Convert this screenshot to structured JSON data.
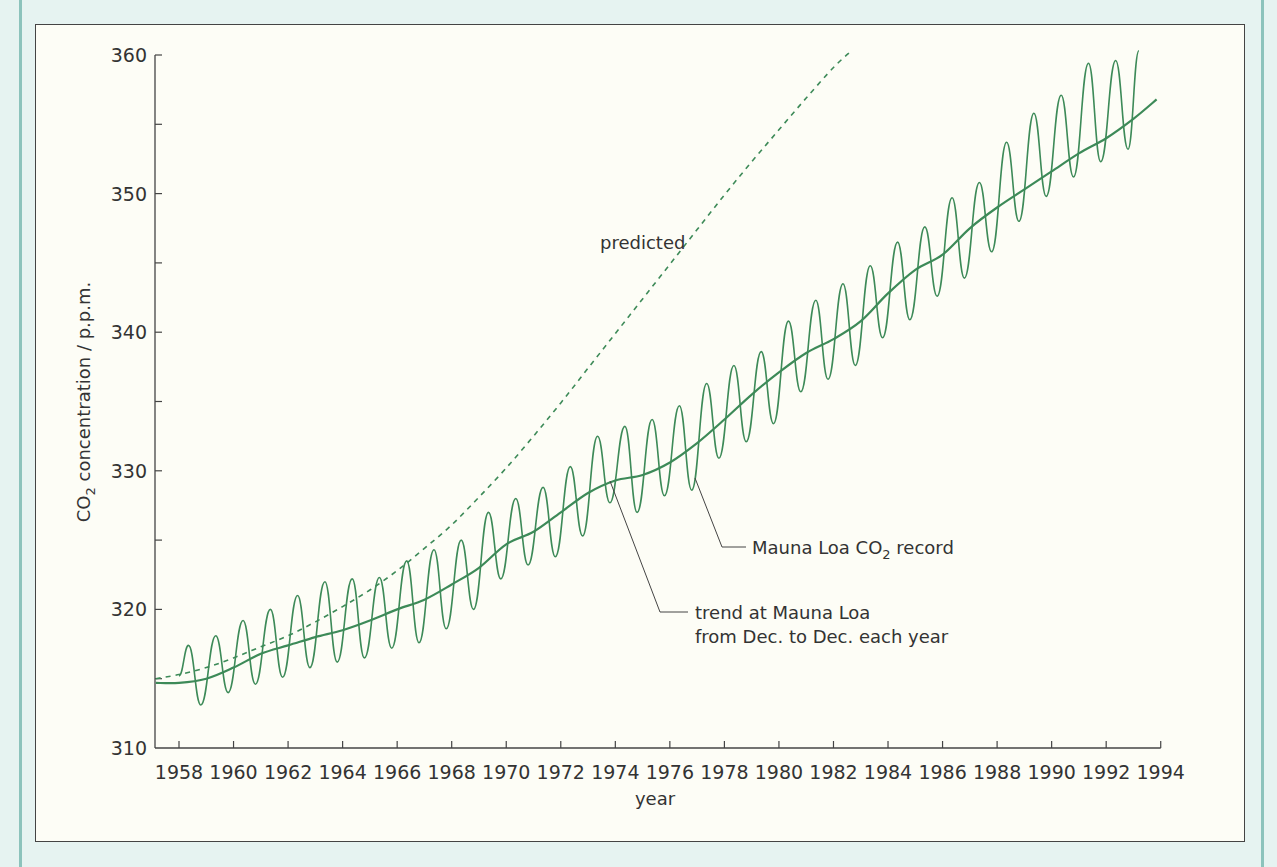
{
  "colors": {
    "line": "#3d8a58",
    "axis": "#444444",
    "text": "#333333",
    "outer_bg": "#e6f3f1",
    "plot_bg": "#fdfdf6"
  },
  "chart_data": {
    "type": "line",
    "title": "",
    "xlabel": "year",
    "ylabel": "CO2 concentration / p.p.m.",
    "ylabel_parts": {
      "pre": "CO",
      "sub": "2",
      "post": " concentration / p.p.m."
    },
    "xlim": [
      1957.1,
      1994
    ],
    "ylim": [
      310,
      360
    ],
    "grid": false,
    "x_ticks": [
      1958,
      1960,
      1962,
      1964,
      1966,
      1968,
      1970,
      1972,
      1974,
      1976,
      1978,
      1980,
      1982,
      1984,
      1986,
      1988,
      1990,
      1992,
      1994
    ],
    "x_tick_labels": [
      "1958",
      "1960",
      "1962",
      "1964",
      "1966",
      "1968",
      "1970",
      "1972",
      "1974",
      "1976",
      "1978",
      "1980",
      "1982",
      "1984",
      "1986",
      "1988",
      "1990",
      "1992",
      "1994"
    ],
    "y_ticks_major": [
      310,
      320,
      330,
      340,
      350,
      360
    ],
    "y_tick_labels": [
      "310",
      "320",
      "330",
      "340",
      "350",
      "360"
    ],
    "y_ticks_minor": [
      315,
      325,
      335,
      345,
      355
    ],
    "series": [
      {
        "name": "Mauna Loa CO2 record",
        "style": "solid-seasonal",
        "extrema": [
          [
            1958.0,
            315.2
          ],
          [
            1958.35,
            317.4
          ],
          [
            1958.8,
            313.1
          ],
          [
            1959.35,
            318.1
          ],
          [
            1959.8,
            314.0
          ],
          [
            1960.35,
            319.2
          ],
          [
            1960.8,
            314.6
          ],
          [
            1961.35,
            320.0
          ],
          [
            1961.8,
            315.1
          ],
          [
            1962.35,
            321.0
          ],
          [
            1962.8,
            315.8
          ],
          [
            1963.35,
            322.0
          ],
          [
            1963.8,
            316.2
          ],
          [
            1964.35,
            322.2
          ],
          [
            1964.8,
            316.5
          ],
          [
            1965.35,
            322.3
          ],
          [
            1965.8,
            317.2
          ],
          [
            1966.35,
            323.5
          ],
          [
            1966.8,
            317.6
          ],
          [
            1967.35,
            324.3
          ],
          [
            1967.8,
            318.6
          ],
          [
            1968.35,
            325.0
          ],
          [
            1968.8,
            320.0
          ],
          [
            1969.35,
            327.0
          ],
          [
            1969.8,
            322.2
          ],
          [
            1970.35,
            328.0
          ],
          [
            1970.8,
            323.2
          ],
          [
            1971.35,
            328.8
          ],
          [
            1971.8,
            323.8
          ],
          [
            1972.35,
            330.3
          ],
          [
            1972.8,
            325.3
          ],
          [
            1973.35,
            332.5
          ],
          [
            1973.8,
            327.7
          ],
          [
            1974.35,
            333.2
          ],
          [
            1974.8,
            327.0
          ],
          [
            1975.35,
            333.7
          ],
          [
            1975.8,
            328.2
          ],
          [
            1976.35,
            334.7
          ],
          [
            1976.8,
            328.6
          ],
          [
            1977.35,
            336.3
          ],
          [
            1977.8,
            330.9
          ],
          [
            1978.35,
            337.6
          ],
          [
            1978.8,
            332.1
          ],
          [
            1979.35,
            338.6
          ],
          [
            1979.8,
            333.4
          ],
          [
            1980.35,
            340.8
          ],
          [
            1980.8,
            335.7
          ],
          [
            1981.35,
            342.3
          ],
          [
            1981.8,
            336.6
          ],
          [
            1982.35,
            343.5
          ],
          [
            1982.8,
            337.6
          ],
          [
            1983.35,
            344.8
          ],
          [
            1983.8,
            339.6
          ],
          [
            1984.35,
            346.5
          ],
          [
            1984.8,
            340.9
          ],
          [
            1985.35,
            347.6
          ],
          [
            1985.8,
            342.6
          ],
          [
            1986.35,
            349.7
          ],
          [
            1986.8,
            343.9
          ],
          [
            1987.35,
            350.8
          ],
          [
            1987.8,
            345.8
          ],
          [
            1988.35,
            353.7
          ],
          [
            1988.8,
            348.0
          ],
          [
            1989.35,
            355.8
          ],
          [
            1989.8,
            349.8
          ],
          [
            1990.35,
            357.1
          ],
          [
            1990.8,
            351.2
          ],
          [
            1991.35,
            359.4
          ],
          [
            1991.8,
            352.3
          ],
          [
            1992.35,
            359.6
          ],
          [
            1992.8,
            353.2
          ],
          [
            1993.2,
            360.3
          ]
        ]
      },
      {
        "name": "trend at Mauna Loa from Dec. to Dec. each year",
        "style": "solid-smooth",
        "points": [
          [
            1957.15,
            314.7
          ],
          [
            1958.0,
            314.7
          ],
          [
            1959.0,
            315.0
          ],
          [
            1960.0,
            315.8
          ],
          [
            1961.0,
            316.8
          ],
          [
            1962.0,
            317.4
          ],
          [
            1963.0,
            318.0
          ],
          [
            1964.0,
            318.5
          ],
          [
            1965.0,
            319.2
          ],
          [
            1966.0,
            320.0
          ],
          [
            1967.0,
            320.7
          ],
          [
            1968.0,
            321.8
          ],
          [
            1969.0,
            323.0
          ],
          [
            1970.0,
            324.7
          ],
          [
            1971.0,
            325.6
          ],
          [
            1972.0,
            327.0
          ],
          [
            1973.0,
            328.4
          ],
          [
            1974.0,
            329.3
          ],
          [
            1975.0,
            329.7
          ],
          [
            1976.0,
            330.6
          ],
          [
            1977.0,
            332.0
          ],
          [
            1978.0,
            333.7
          ],
          [
            1979.0,
            335.5
          ],
          [
            1980.0,
            337.1
          ],
          [
            1981.0,
            338.5
          ],
          [
            1982.0,
            339.5
          ],
          [
            1983.0,
            340.8
          ],
          [
            1984.0,
            342.8
          ],
          [
            1985.0,
            344.5
          ],
          [
            1986.0,
            345.6
          ],
          [
            1987.0,
            347.5
          ],
          [
            1988.0,
            349.0
          ],
          [
            1989.0,
            350.3
          ],
          [
            1990.0,
            351.6
          ],
          [
            1991.0,
            352.9
          ],
          [
            1992.0,
            354.0
          ],
          [
            1993.0,
            355.4
          ],
          [
            1993.85,
            356.8
          ]
        ]
      },
      {
        "name": "predicted",
        "style": "dashed",
        "points": [
          [
            1957.15,
            315.0
          ],
          [
            1958.0,
            315.3
          ],
          [
            1959.0,
            315.8
          ],
          [
            1960.0,
            316.5
          ],
          [
            1961.0,
            317.3
          ],
          [
            1962.0,
            318.1
          ],
          [
            1963.0,
            319.1
          ],
          [
            1964.0,
            320.2
          ],
          [
            1965.0,
            321.4
          ],
          [
            1966.0,
            322.8
          ],
          [
            1967.0,
            324.4
          ],
          [
            1968.0,
            326.1
          ],
          [
            1969.0,
            328.1
          ],
          [
            1970.0,
            330.2
          ],
          [
            1971.0,
            332.5
          ],
          [
            1972.0,
            334.9
          ],
          [
            1973.0,
            337.4
          ],
          [
            1974.0,
            339.9
          ],
          [
            1975.0,
            342.4
          ],
          [
            1976.0,
            344.9
          ],
          [
            1977.0,
            347.4
          ],
          [
            1978.0,
            349.9
          ],
          [
            1979.0,
            352.3
          ],
          [
            1980.0,
            354.6
          ],
          [
            1981.0,
            356.9
          ],
          [
            1982.0,
            359.1
          ],
          [
            1982.6,
            360.2
          ]
        ]
      }
    ],
    "annotations": [
      {
        "text": "predicted",
        "x_px": 600,
        "y_px": 249
      },
      {
        "text_pre": "Mauna Loa  CO",
        "text_sub": "2",
        "text_post": " record",
        "x_px": 752,
        "y_px": 554
      },
      {
        "text": "trend at Mauna Loa",
        "x_px": 695,
        "y_px": 619
      },
      {
        "text": "from Dec. to Dec. each year",
        "x_px": 695,
        "y_px": 643
      }
    ]
  },
  "labels": {
    "xlabel": "year",
    "predicted": "predicted",
    "record_pre": "Mauna Loa  CO",
    "record_sub": "2",
    "record_post": " record",
    "trend_line1": "trend at Mauna Loa",
    "trend_line2": "from Dec. to Dec. each year",
    "ylabel_pre": "CO",
    "ylabel_sub": "2",
    "ylabel_post": " concentration / p.p.m."
  }
}
